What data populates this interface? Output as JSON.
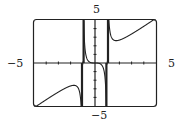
{
  "chart_data": {
    "type": "line",
    "title": "",
    "function": "f(x) = x^3/(x^2-1)",
    "xlim": [
      -5,
      5
    ],
    "ylim": [
      -5,
      5
    ],
    "xlabel": "",
    "ylabel": "",
    "tick_labels": {
      "x_min": "−5",
      "x_max": "5",
      "y_min": "−5",
      "y_max": "5"
    },
    "vertical_asymptotes": [
      -1,
      1
    ],
    "grid": false,
    "series": [
      {
        "name": "f(x)",
        "x": [
          -5,
          -4,
          -3,
          -2,
          -1.73,
          -1.5,
          -1.2,
          -0.8,
          -0.5,
          0,
          0.5,
          0.8,
          1.2,
          1.5,
          1.73,
          2,
          3,
          4,
          5
        ],
        "values": [
          -5.21,
          -4.27,
          -3.38,
          -2.67,
          -2.6,
          -2.7,
          -3.93,
          3.56,
          0.17,
          0,
          -0.17,
          -3.56,
          3.93,
          2.7,
          2.6,
          2.67,
          3.38,
          4.27,
          5.21
        ]
      }
    ]
  },
  "labels": {
    "top": "5",
    "bottom": "−5",
    "left": "−5",
    "right": "5"
  }
}
